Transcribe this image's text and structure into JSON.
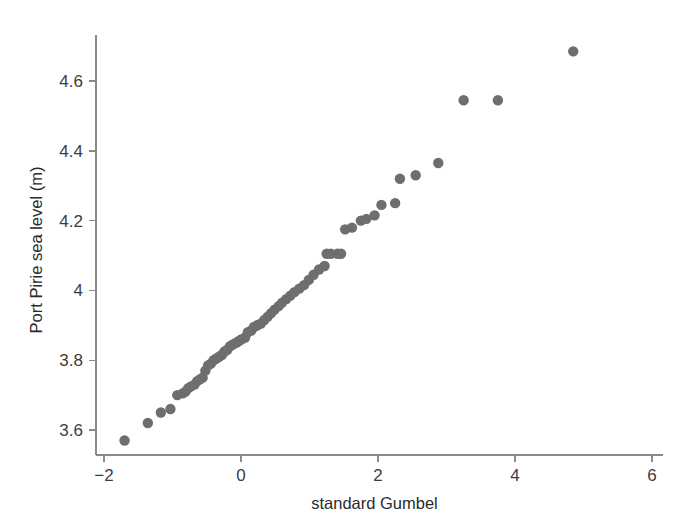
{
  "figure": {
    "background_color": "#ffffff",
    "axis_color": "#8a8a8a",
    "point_color": "#6e6e6e",
    "point_radius": 5.2
  },
  "chart_data": {
    "type": "scatter",
    "title": "",
    "xlabel": "standard Gumbel",
    "ylabel": "Port Pirie sea level (m)",
    "xlim": [
      -2.1,
      6.1
    ],
    "ylim": [
      3.53,
      4.73
    ],
    "xticks": [
      -2,
      0,
      2,
      4,
      6
    ],
    "xtick_labels": [
      "−2",
      "0",
      "2",
      "4",
      "6"
    ],
    "yticks": [
      3.6,
      3.8,
      4.0,
      4.2,
      4.4,
      4.6
    ],
    "ytick_labels": [
      "3.6",
      "3.8",
      "4",
      "4.2",
      "4.4",
      "4.6"
    ],
    "grid": false,
    "legend": null,
    "n_points": 65,
    "x": [
      -1.7,
      -1.36,
      -1.17,
      -1.03,
      -0.93,
      -0.85,
      -0.81,
      -0.77,
      -0.73,
      -0.68,
      -0.64,
      -0.6,
      -0.56,
      -0.52,
      -0.48,
      -0.44,
      -0.4,
      -0.36,
      -0.32,
      -0.28,
      -0.24,
      -0.2,
      -0.16,
      -0.12,
      -0.07,
      -0.03,
      0.01,
      0.06,
      0.1,
      0.15,
      0.19,
      0.24,
      0.29,
      0.34,
      0.39,
      0.44,
      0.49,
      0.55,
      0.6,
      0.66,
      0.72,
      0.78,
      0.85,
      0.92,
      0.99,
      1.06,
      1.14,
      1.22,
      1.25,
      1.31,
      1.41,
      1.46,
      1.52,
      1.62,
      1.75,
      1.83,
      1.95,
      2.05,
      2.25,
      2.32,
      2.55,
      2.88,
      3.25,
      3.75,
      4.85
    ],
    "y": [
      3.57,
      3.62,
      3.65,
      3.66,
      3.7,
      3.705,
      3.71,
      3.72,
      3.725,
      3.73,
      3.74,
      3.745,
      3.75,
      3.77,
      3.785,
      3.79,
      3.8,
      3.805,
      3.81,
      3.815,
      3.825,
      3.83,
      3.84,
      3.845,
      3.85,
      3.855,
      3.86,
      3.865,
      3.88,
      3.885,
      3.895,
      3.9,
      3.905,
      3.915,
      3.925,
      3.935,
      3.945,
      3.955,
      3.965,
      3.975,
      3.985,
      3.995,
      4.005,
      4.015,
      4.03,
      4.045,
      4.06,
      4.07,
      4.105,
      4.105,
      4.105,
      4.105,
      4.175,
      4.18,
      4.2,
      4.205,
      4.215,
      4.245,
      4.25,
      4.32,
      4.33,
      4.365,
      4.545,
      4.545,
      4.685
    ]
  }
}
